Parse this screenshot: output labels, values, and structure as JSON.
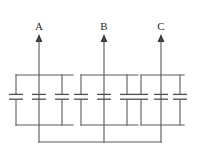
{
  "diagram": {
    "type": "electrical-schematic",
    "width": 198,
    "height": 161,
    "background_color": "#ffffff",
    "wire_color": "#5a5a5a",
    "label_color": "#2b2b2b",
    "phases": [
      {
        "id": "A",
        "label": "A",
        "label_x": 39,
        "label_y": 30,
        "arrow_x": 39,
        "arrow_tip_y": 36,
        "feeder_top_y": 36,
        "feeder_bottom_y": 142,
        "bus_left_x": 16,
        "bus_right_x": 73,
        "bus_top_y": 75,
        "bus_bottom_y": 125,
        "capacitor_count": 3,
        "capacitor_x": [
          16,
          39,
          62
        ],
        "capacitor_y": 97,
        "neutral_drop_x": 39
      },
      {
        "id": "B",
        "label": "B",
        "label_x": 104,
        "label_y": 30,
        "arrow_x": 104,
        "arrow_tip_y": 36,
        "feeder_top_y": 36,
        "feeder_bottom_y": 142,
        "bus_left_x": 81,
        "bus_right_x": 138,
        "bus_top_y": 75,
        "bus_bottom_y": 125,
        "capacitor_count": 3,
        "capacitor_x": [
          81,
          104,
          127
        ],
        "capacitor_y": 97,
        "neutral_drop_x": 104
      },
      {
        "id": "C",
        "label": "C",
        "label_x": 161,
        "label_y": 30,
        "arrow_x": 161,
        "arrow_tip_y": 36,
        "feeder_top_y": 36,
        "feeder_bottom_y": 142,
        "bus_left_x": 141,
        "bus_right_x": 184,
        "bus_top_y": 75,
        "bus_bottom_y": 125,
        "capacitor_count": 3,
        "capacitor_x": [
          141,
          161,
          180
        ],
        "capacitor_y": 97,
        "neutral_drop_x": 161
      }
    ],
    "neutral_bus": {
      "y": 142,
      "left_x": 39,
      "right_x": 161
    },
    "capacitor_symbol": {
      "plate_half_width": 7,
      "plate_gap": 3.5
    }
  }
}
